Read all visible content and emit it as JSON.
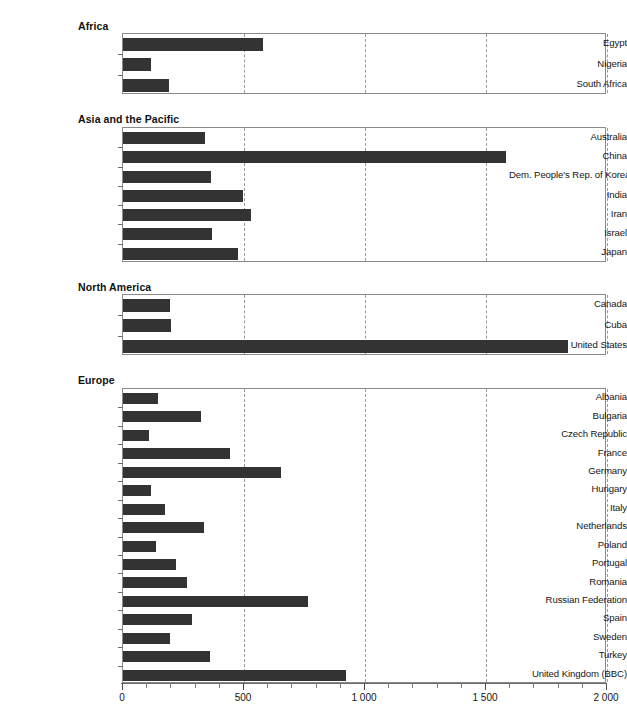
{
  "chart_data": {
    "type": "bar",
    "orientation": "horizontal",
    "title": "",
    "xlabel": "",
    "ylabel": "",
    "xlim": [
      0,
      2000
    ],
    "xticks": [
      0,
      500,
      1000,
      1500,
      2000
    ],
    "xtick_labels": [
      "0",
      "500",
      "1 000",
      "1 500",
      "2 000"
    ],
    "grid": "vertical-dashed",
    "legend": "none",
    "bar_color": "#333333",
    "panels": [
      {
        "title": "Africa",
        "categories": [
          "Egypt",
          "Nigeria",
          "South Africa"
        ],
        "values": [
          578,
          116,
          190
        ]
      },
      {
        "title": "Asia and the Pacific",
        "categories": [
          "Australia",
          "China",
          "Dem. People's Rep. of Korea",
          "India",
          "Iran",
          "Israel",
          "Japan"
        ],
        "values": [
          339,
          1583,
          364,
          496,
          529,
          368,
          475
        ]
      },
      {
        "title": "North America",
        "categories": [
          "Canada",
          "Cuba",
          "United States"
        ],
        "values": [
          196,
          200,
          1839
        ]
      },
      {
        "title": "Europe",
        "categories": [
          "Albania",
          "Bulgaria",
          "Czech Republic",
          "France",
          "Germany",
          "Hungary",
          "Italy",
          "Netherlands",
          "Poland",
          "Portugal",
          "Romania",
          "Russian Federation",
          "Spain",
          "Sweden",
          "Turkey",
          "United Kingdom (BBC)"
        ],
        "values": [
          145,
          322,
          107,
          442,
          653,
          116,
          174,
          335,
          136,
          219,
          264,
          764,
          285,
          194,
          359,
          922
        ]
      }
    ]
  },
  "layout": {
    "panel_geometry": [
      {
        "title_top": 20,
        "plot_top": 33,
        "plot_height": 61
      },
      {
        "title_top": 113,
        "plot_top": 127,
        "plot_height": 135
      },
      {
        "title_top": 281,
        "plot_top": 294,
        "plot_height": 61
      },
      {
        "title_top": 374,
        "plot_top": 388,
        "plot_height": 295
      }
    ]
  }
}
